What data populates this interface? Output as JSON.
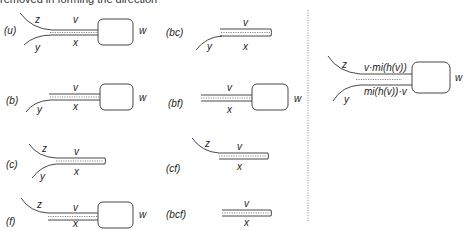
{
  "caption_fragment": "removed in forming the direction",
  "panels": [
    {
      "id": "u",
      "case": "(u)",
      "labels": {
        "z": "z",
        "y": "y",
        "v": "v",
        "x": "x",
        "w": "w"
      }
    },
    {
      "id": "bc",
      "case": "(bc)",
      "labels": {
        "y": "y",
        "v": "v",
        "x": "x"
      }
    },
    {
      "id": "b",
      "case": "(b)",
      "labels": {
        "y": "y",
        "v": "v",
        "x": "x",
        "w": "w"
      }
    },
    {
      "id": "bf",
      "case": "(bf)",
      "labels": {
        "v": "v",
        "x": "x",
        "w": "w"
      }
    },
    {
      "id": "c",
      "case": "(c)",
      "labels": {
        "z": "z",
        "y": "y",
        "v": "v",
        "x": "x"
      }
    },
    {
      "id": "cf",
      "case": "(cf)",
      "labels": {
        "z": "z",
        "v": "v",
        "x": "x"
      }
    },
    {
      "id": "f",
      "case": "(f)",
      "labels": {
        "z": "z",
        "v": "v",
        "x": "x",
        "w": "w"
      }
    },
    {
      "id": "bcf",
      "case": "(bcf)",
      "labels": {
        "v": "v",
        "x": "x"
      }
    }
  ],
  "right_panel": {
    "labels": {
      "z": "z",
      "y": "y",
      "w": "w",
      "top": "v·mi(h(v))",
      "bottom": "mi(h(v))·v"
    }
  }
}
